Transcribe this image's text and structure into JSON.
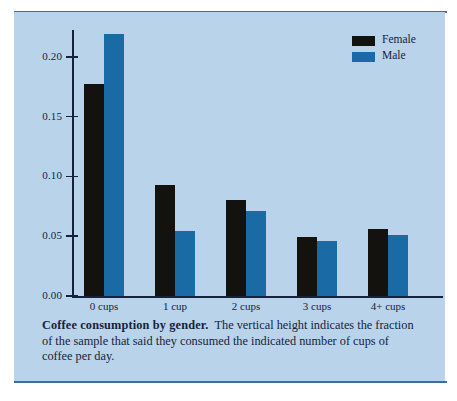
{
  "figure": {
    "panel_color": "#b9d3ea",
    "rule_color": "#3c6ea5",
    "caption_lead": "Coffee consumption by gender.",
    "caption_body": "The vertical height indicates the fraction of the sample that said they consumed the indicated number of cups of coffee per day."
  },
  "legend": {
    "position": "top-right",
    "entries": [
      {
        "label": "Female",
        "color": "#14120f"
      },
      {
        "label": "Male",
        "color": "#1a6ba5"
      }
    ]
  },
  "axes": {
    "ytick_labels": [
      "0.20",
      "0.15",
      "0.10",
      "0.05",
      "0.00"
    ],
    "xtick_labels": [
      "0 cups",
      "1 cup",
      "2 cups",
      "3 cups",
      "4+ cups"
    ]
  },
  "chart_data": {
    "type": "bar",
    "title": "Coffee consumption by gender",
    "xlabel": "",
    "ylabel": "",
    "categories": [
      "0 cups",
      "1 cup",
      "2 cups",
      "3 cups",
      "4+ cups"
    ],
    "series": [
      {
        "name": "Female",
        "color": "#14120f",
        "values": [
          0.177,
          0.093,
          0.08,
          0.049,
          0.056
        ]
      },
      {
        "name": "Male",
        "color": "#1a6ba5",
        "values": [
          0.219,
          0.054,
          0.071,
          0.046,
          0.051
        ]
      }
    ],
    "ylim": [
      0.0,
      0.2225
    ],
    "yticks": [
      0.0,
      0.05,
      0.1,
      0.15,
      0.2
    ],
    "grid": false,
    "legend_position": "upper right"
  }
}
